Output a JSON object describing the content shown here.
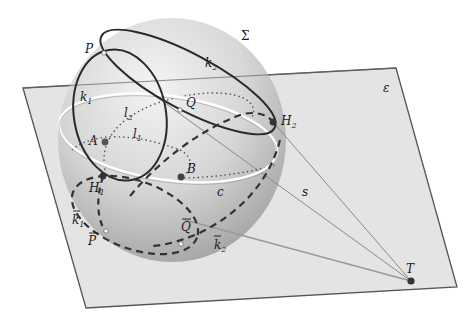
{
  "figure": {
    "colors": {
      "plane_fill": "#e6e6e6",
      "plane_edge": "#555555",
      "sphere_light": "#f2f2f2",
      "sphere_dark": "#9a9a9a",
      "curve": "#2a2a2a",
      "circle_c": "#ffffff",
      "ray": "#8a8a8a",
      "point": "#444444"
    },
    "labels": {
      "sphere": "Σ",
      "plane": "ε",
      "P": "P",
      "Q": "Q",
      "k1": "k",
      "k1_sub": "1",
      "k2": "k",
      "k2_sub": "2",
      "l1": "l",
      "l1_sub": "1",
      "l2": "l",
      "l2_sub": "2",
      "A": "A",
      "B": "B",
      "H1": "H",
      "H1_sub": "1",
      "H2": "H",
      "H2_sub": "2",
      "c": "c",
      "s": "s",
      "T": "T",
      "k1bar": "k",
      "k1bar_sub": "1",
      "k2bar": "k",
      "k2bar_sub": "2",
      "Pbar": "P",
      "Qbar": "Q"
    }
  }
}
